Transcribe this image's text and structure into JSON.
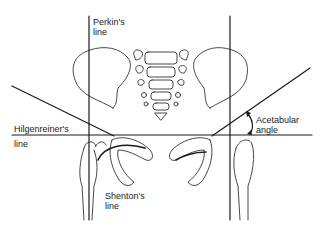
{
  "figure": {
    "labels": {
      "perkins_line_1": "Perkin's",
      "perkins_line_2": "line",
      "hilgenreiners_line_1": "Hilgenreiner's",
      "hilgenreiners_line_2": "line",
      "acetabular_angle_1": "Acetabular",
      "acetabular_angle_2": "angle",
      "shentons_line_1": "Shenton's",
      "shentons_line_2": "line"
    },
    "colors": {
      "line": "#1a1a1a",
      "outline": "#333333",
      "background": "#ffffff"
    }
  }
}
